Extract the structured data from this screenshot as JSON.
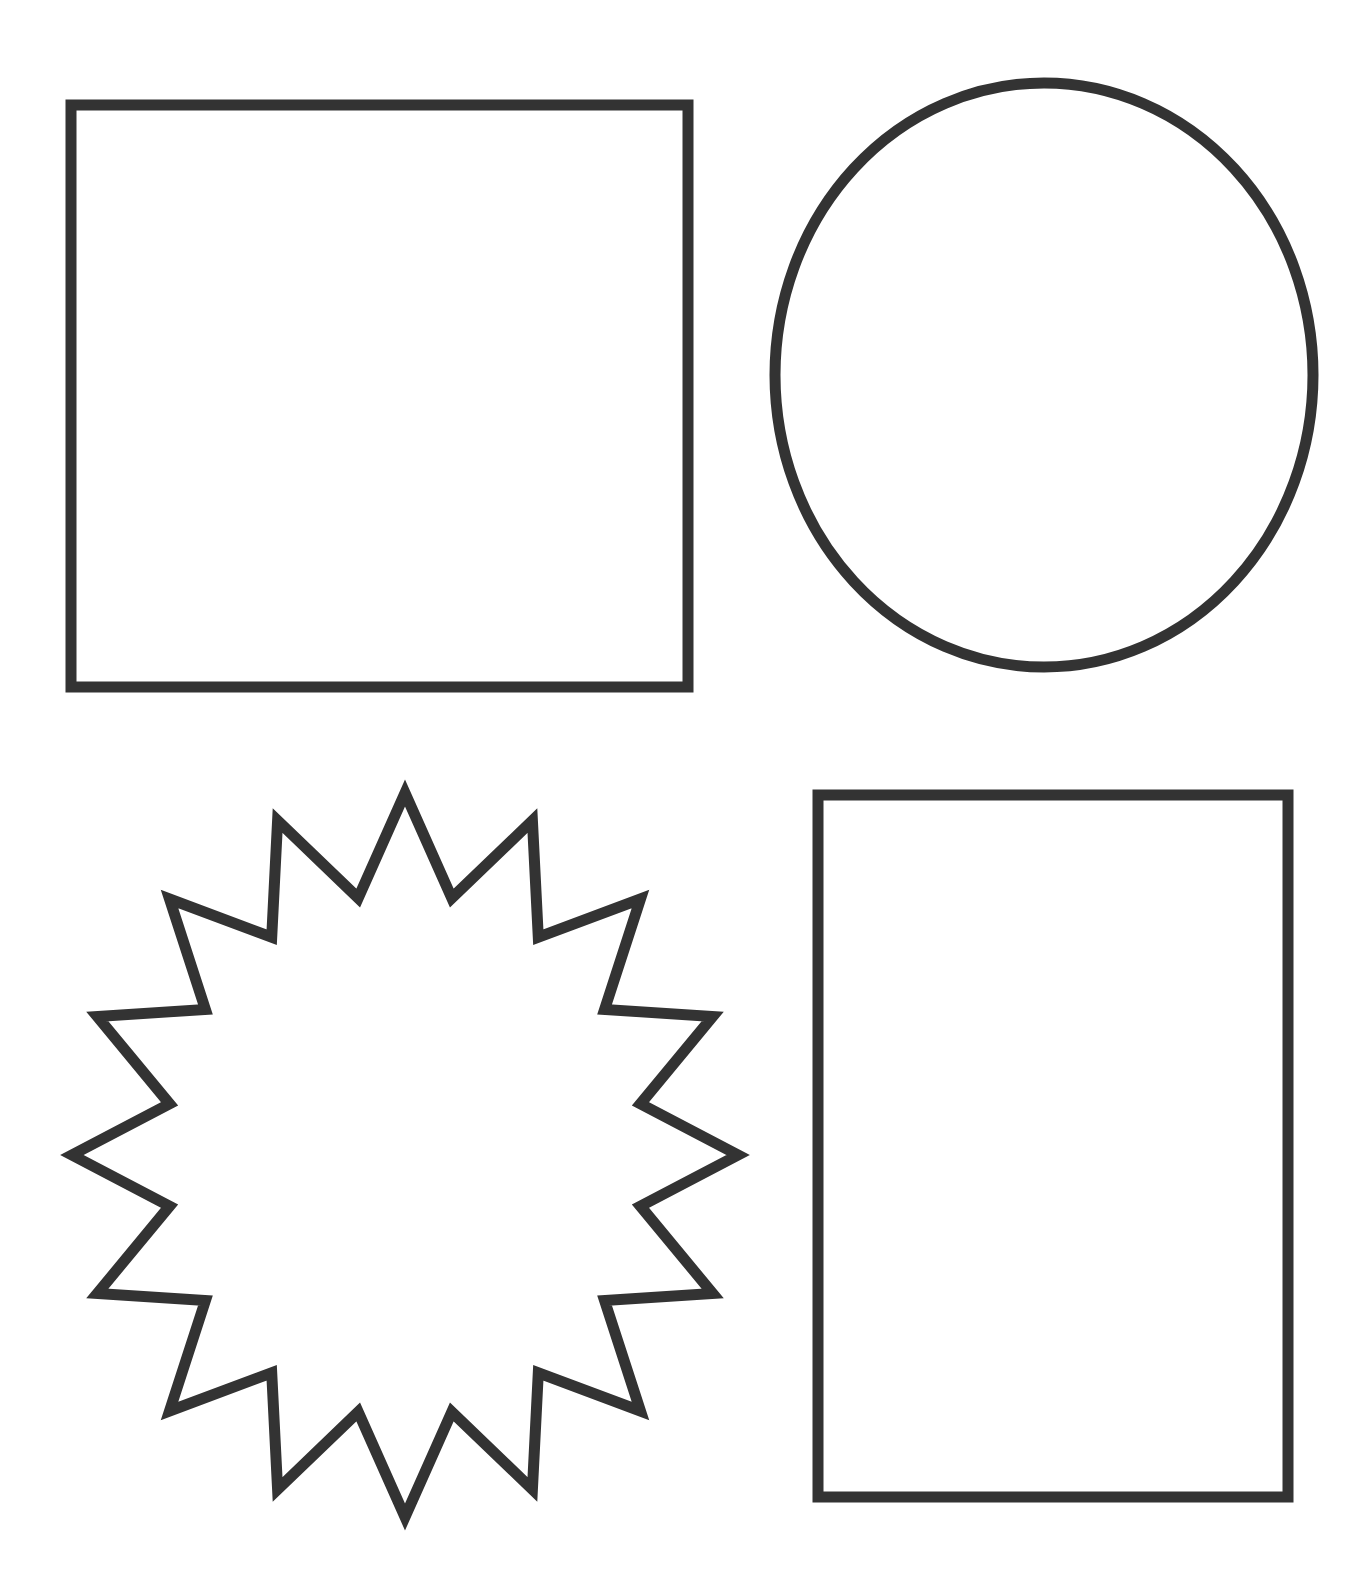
{
  "canvas": {
    "width": 1366,
    "height": 1581,
    "background": "#ffffff"
  },
  "style": {
    "stroke_color": "#333333",
    "stroke_width": 11,
    "fill": "#ffffff"
  },
  "shapes": [
    {
      "name": "square",
      "type": "rect",
      "x": 71,
      "y": 105,
      "width": 617,
      "height": 582
    },
    {
      "name": "circle",
      "type": "ellipse",
      "cx": 1044,
      "cy": 375,
      "rx": 269,
      "ry": 292
    },
    {
      "name": "starburst",
      "type": "star",
      "cx": 405,
      "cy": 1155,
      "points": 16,
      "outer_rx": 333,
      "outer_ry": 362,
      "inner_rx": 240,
      "inner_ry": 262
    },
    {
      "name": "tall-rectangle",
      "type": "rect",
      "x": 818,
      "y": 795,
      "width": 470,
      "height": 702
    }
  ]
}
